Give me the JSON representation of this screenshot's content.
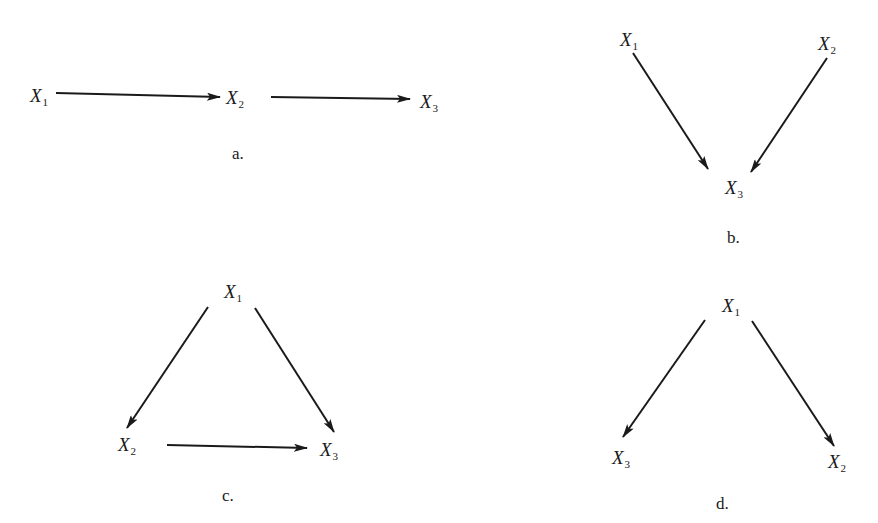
{
  "diagrams": [
    {
      "id": "a",
      "caption": "a.",
      "caption_pos": [
        232,
        145
      ],
      "nodes": [
        {
          "var": "X",
          "sub": "1",
          "pos": [
            30,
            86
          ]
        },
        {
          "var": "X",
          "sub": "2",
          "pos": [
            226,
            88
          ]
        },
        {
          "var": "X",
          "sub": "3",
          "pos": [
            420,
            92
          ]
        }
      ],
      "edges": [
        {
          "from": "X1",
          "to": "X2",
          "x1": 56,
          "y1": 93,
          "x2": 220,
          "y2": 97
        },
        {
          "from": "X2",
          "to": "X3",
          "x1": 271,
          "y1": 97,
          "x2": 410,
          "y2": 99
        }
      ]
    },
    {
      "id": "b",
      "caption": "b.",
      "caption_pos": [
        727,
        229
      ],
      "nodes": [
        {
          "var": "X",
          "sub": "1",
          "pos": [
            620,
            30
          ]
        },
        {
          "var": "X",
          "sub": "2",
          "pos": [
            818,
            34
          ]
        },
        {
          "var": "X",
          "sub": "3",
          "pos": [
            725,
            178
          ]
        }
      ],
      "edges": [
        {
          "from": "X1",
          "to": "X3",
          "x1": 633,
          "y1": 53,
          "x2": 708,
          "y2": 169
        },
        {
          "from": "X2",
          "to": "X3",
          "x1": 827,
          "y1": 58,
          "x2": 751,
          "y2": 172
        }
      ]
    },
    {
      "id": "c",
      "caption": "c.",
      "caption_pos": [
        222,
        487
      ],
      "nodes": [
        {
          "var": "X",
          "sub": "1",
          "pos": [
            224,
            282
          ]
        },
        {
          "var": "X",
          "sub": "2",
          "pos": [
            118,
            435
          ]
        },
        {
          "var": "X",
          "sub": "3",
          "pos": [
            320,
            440
          ]
        }
      ],
      "edges": [
        {
          "from": "X1",
          "to": "X2",
          "x1": 208,
          "y1": 307,
          "x2": 127,
          "y2": 428
        },
        {
          "from": "X1",
          "to": "X3",
          "x1": 255,
          "y1": 308,
          "x2": 334,
          "y2": 432
        },
        {
          "from": "X2",
          "to": "X3",
          "x1": 167,
          "y1": 445,
          "x2": 307,
          "y2": 448
        }
      ]
    },
    {
      "id": "d",
      "caption": "d.",
      "caption_pos": [
        716,
        495
      ],
      "nodes": [
        {
          "var": "X",
          "sub": "1",
          "pos": [
            722,
            296
          ]
        },
        {
          "var": "X",
          "sub": "3",
          "pos": [
            612,
            448
          ]
        },
        {
          "var": "X",
          "sub": "2",
          "pos": [
            828,
            452
          ]
        }
      ],
      "edges": [
        {
          "from": "X1",
          "to": "X3",
          "x1": 705,
          "y1": 320,
          "x2": 623,
          "y2": 437
        },
        {
          "from": "X1",
          "to": "X2",
          "x1": 752,
          "y1": 321,
          "x2": 834,
          "y2": 446
        }
      ]
    }
  ],
  "style": {
    "ink_color": "#1a1a1a",
    "background": "#ffffff"
  }
}
